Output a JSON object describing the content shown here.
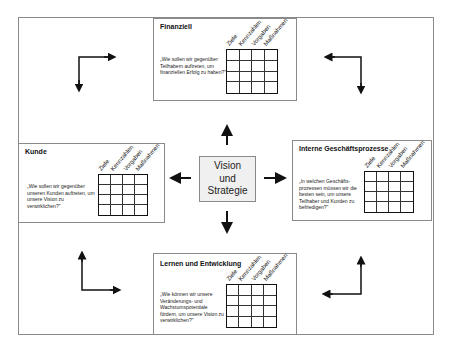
{
  "center": {
    "lines": [
      "Vision",
      "und",
      "Strategie"
    ]
  },
  "column_headers": [
    "Ziele",
    "Kennzahlen",
    "Vorgaben",
    "Maßnahmen"
  ],
  "perspectives": {
    "financial": {
      "title": "Finanziell",
      "question": "„Wie sollen wir gegenüber Teilhabern auftreten, um finanziellen Erfolg zu haben?\"",
      "headers": [
        "Ziele",
        "Kennzahlen",
        "Vorgaben",
        "Maßnahmen"
      ]
    },
    "customer": {
      "title": "Kunde",
      "question": "„Wie sollen wir gegenüber unseren Kunden auftreten, um unsere Vision zu verwirklichen?\"",
      "headers": [
        "Ziele",
        "Kennzahlen",
        "Vorgaben",
        "Maßnahmen"
      ]
    },
    "internal": {
      "title": "Interne Geschäftsprozesse",
      "question": "„In welchen Geschäfts-prozessen müssen wir die besten sein, um unsere Teilhaber und Kunden zu befriedigen?\"",
      "headers": [
        "Ziele",
        "Kennzahlen",
        "Vorgaben",
        "Maßnahmen"
      ]
    },
    "learning": {
      "title": "Lernen und Entwicklung",
      "question": "„Wie können wir unsere Veränderungs- und Wachstumspotentiale fördern, um unsere Vision zu verwirklichen?\"",
      "headers": [
        "Ziele",
        "Kennzahlen",
        "Vorgaben",
        "Maßnahmen"
      ]
    }
  },
  "grid": {
    "rows": 4,
    "cols": 4
  },
  "colors": {
    "border": "#8a8a8a",
    "center_fill": "#f0f0f0",
    "arrow": "#111111"
  }
}
